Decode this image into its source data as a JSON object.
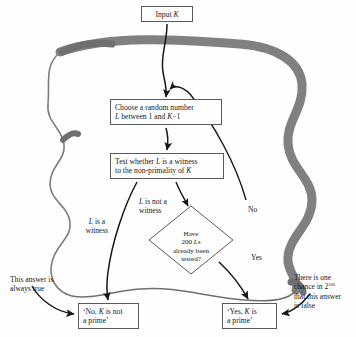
{
  "diagram": {
    "type": "flowchart",
    "nodes": {
      "input": "Input K",
      "choose": "Choose a random number L between 1 and K−1",
      "test": "Test whether L is a witness to the non-primality of K",
      "decision": "Have 200 Ls already been tested?",
      "no_prime": "‘No, K is not a prime’",
      "yes_prime": "‘Yes, K is a prime’"
    },
    "edge_labels": {
      "witness": "L is a witness",
      "not_witness": "L is not a witness",
      "no": "No",
      "yes": "Yes"
    },
    "annotations": {
      "left": "This answer is always true",
      "right": "There is one chance in 2²⁰⁰ that this answer is false"
    },
    "colors": {
      "stroke": "#17171a",
      "node_border": "#5a5a5a",
      "loop_gray": "#808080",
      "background": "#fefefe"
    }
  }
}
